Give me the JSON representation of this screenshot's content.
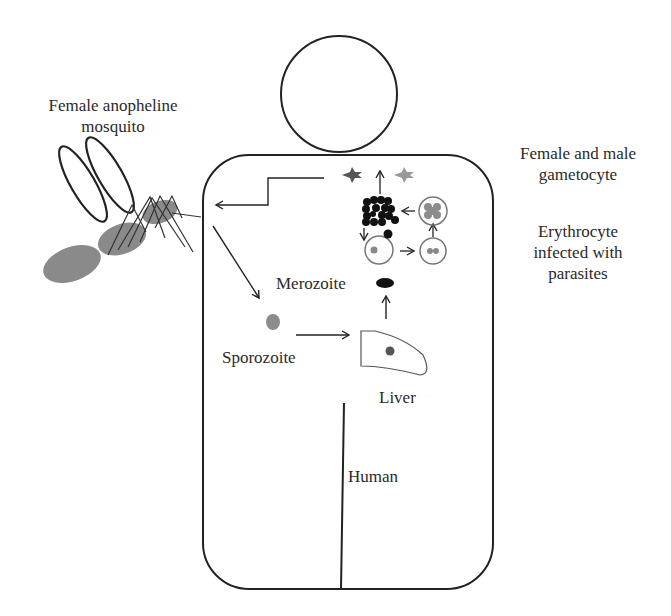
{
  "diagram": {
    "colors": {
      "stroke": "#222222",
      "mosquito_body": "#8a8a8a",
      "parasite_gray": "#8c8c8c",
      "parasite_dark": "#111111",
      "cell_outline": "#7a7a7a"
    },
    "labels": {
      "mosquito_line1": "Female anopheline",
      "mosquito_line2": "mosquito",
      "gametocyte_line1": "Female and male",
      "gametocyte_line2": "gametocyte",
      "erythrocyte_line1": "Erythrocyte",
      "erythrocyte_line2": "infected with",
      "erythrocyte_line3": "parasites",
      "merozoite": "Merozoite",
      "sporozoite": "Sporozoite",
      "liver": "Liver",
      "human": "Human"
    },
    "nodes": [
      {
        "id": "mosquito",
        "label": "Female anopheline mosquito"
      },
      {
        "id": "sporozoite",
        "label": "Sporozoite"
      },
      {
        "id": "liver",
        "label": "Liver"
      },
      {
        "id": "merozoite",
        "label": "Merozoite"
      },
      {
        "id": "erythrocyte",
        "label": "Erythrocyte infected with parasites"
      },
      {
        "id": "gametocyte",
        "label": "Female and male gametocyte"
      },
      {
        "id": "human",
        "label": "Human"
      }
    ],
    "edges": [
      {
        "from": "mosquito",
        "to": "sporozoite"
      },
      {
        "from": "sporozoite",
        "to": "liver"
      },
      {
        "from": "liver",
        "to": "merozoite"
      },
      {
        "from": "merozoite",
        "to": "erythrocyte"
      },
      {
        "from": "erythrocyte",
        "to": "gametocyte"
      },
      {
        "from": "gametocyte",
        "to": "mosquito"
      }
    ]
  }
}
